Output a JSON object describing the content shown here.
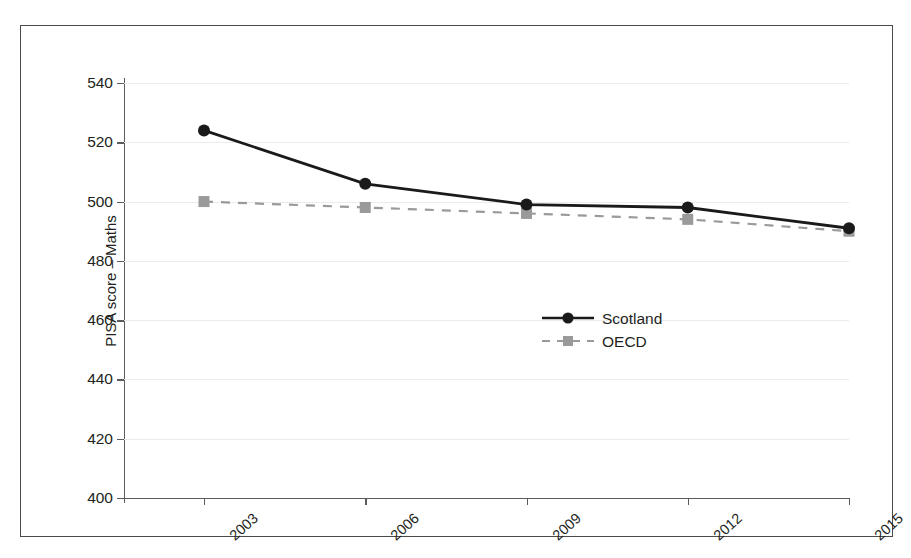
{
  "chart_data": {
    "type": "line",
    "title": "",
    "subtitle": "",
    "xlabel": "",
    "ylabel": "PISA score – Maths",
    "categories": [
      "2003",
      "2006",
      "2009",
      "2012",
      "2015"
    ],
    "x_tick_labels": [
      "2003",
      "2006",
      "2009",
      "2012",
      "2015"
    ],
    "y_tick_labels": [
      "400",
      "420",
      "440",
      "460",
      "480",
      "500",
      "520",
      "540"
    ],
    "y_ticks": [
      400,
      420,
      440,
      460,
      480,
      500,
      520,
      540
    ],
    "ylim": [
      400,
      540
    ],
    "grid": "horizontal-only",
    "legend_position": "inside-lower-right",
    "series": [
      {
        "name": "Scotland",
        "values": [
          524,
          506,
          499,
          498,
          491
        ],
        "color": "#1a1a1a",
        "line_style": "solid",
        "marker": "circle"
      },
      {
        "name": "OECD",
        "values": [
          500,
          498,
          496,
          494,
          490
        ],
        "color": "#9a9a9a",
        "line_style": "dashed",
        "marker": "square"
      }
    ],
    "annotations": []
  },
  "legend": {
    "items": [
      {
        "label": "Scotland"
      },
      {
        "label": "OECD"
      }
    ]
  },
  "colors": {
    "scotland": "#1a1a1a",
    "oecd": "#9a9a9a",
    "axis": "#5b5b5b",
    "grid": "#eceaea",
    "frame": "#4a4a4a",
    "text": "#231f20"
  }
}
